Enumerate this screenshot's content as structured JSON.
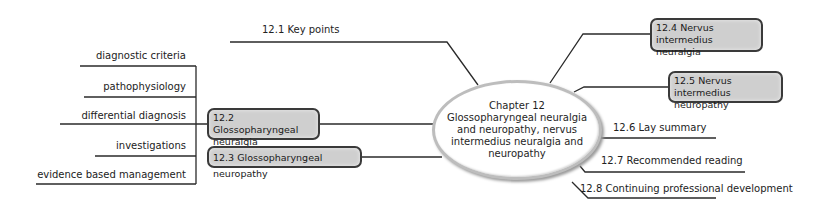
{
  "center": {
    "chapter": "Chapter 12",
    "title_line1": "Glossopharyngeal neuralgia",
    "title_line2": "and neuropathy, nervus",
    "title_line3": "intermedius neuralgia and",
    "title_line4": "neuropathy"
  },
  "branches_left": [
    {
      "id": "12.1",
      "label": "12.1 Key points",
      "boxed": false
    },
    {
      "id": "12.2",
      "label_line1": "12.2 Glossopharyngeal",
      "label_line2": "neuralgia",
      "boxed": true,
      "children": [
        "diagnostic criteria",
        "pathophysiology",
        "differential diagnosis",
        "investigations",
        "evidence based management"
      ]
    },
    {
      "id": "12.3",
      "label": "12.3 Glossopharyngeal neuropathy",
      "boxed": true
    }
  ],
  "branches_right": [
    {
      "id": "12.4",
      "label_line1": "12.4 Nervus intermedius",
      "label_line2": "neuralgia",
      "boxed": true
    },
    {
      "id": "12.5",
      "label_line1": "12.5 Nervus intermedius",
      "label_line2": "neuropathy",
      "boxed": true
    },
    {
      "id": "12.6",
      "label": "12.6 Lay summary",
      "boxed": false
    },
    {
      "id": "12.7",
      "label": "12.7 Recommended reading",
      "boxed": false
    },
    {
      "id": "12.8",
      "label": "12.8 Continuing professional development",
      "boxed": false
    }
  ],
  "colors": {
    "box_fill": "#cfcfcf",
    "box_border": "#3a3a3a",
    "line": "#2a2a2a",
    "ellipse_border": "#bdbdbd"
  }
}
